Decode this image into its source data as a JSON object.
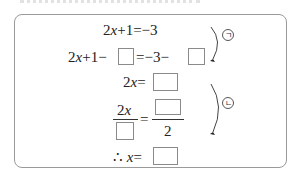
{
  "problem": {
    "steps": [
      {
        "id": "step1",
        "left": "2x+1",
        "eq": "=",
        "right": "−3"
      },
      {
        "id": "step2",
        "left_prefix": "2x+1−",
        "eq": "=",
        "right_prefix": "−3−",
        "blanks": 2
      },
      {
        "id": "step3",
        "left": "2x",
        "eq": "=",
        "blanks": 1
      },
      {
        "id": "step4",
        "numerator_left": "2x",
        "eq": "=",
        "denominator_right": "2",
        "blanks": 2
      },
      {
        "id": "step5",
        "therefore": "∴",
        "left": "x",
        "eq": "=",
        "blanks": 1
      }
    ],
    "annotations": [
      {
        "label": "ㄱ",
        "symbol": "circled-giyeok",
        "spans": "step1-step2"
      },
      {
        "label": "ㄴ",
        "symbol": "circled-nieun",
        "spans": "step3-step4"
      }
    ]
  },
  "texts": {
    "s1_a": "2",
    "s1_x": "x",
    "s1_b": "+1",
    "s1_eq": "=",
    "s1_r": "−3",
    "s2_a": "2",
    "s2_x": "x",
    "s2_b": "+1−",
    "s2_eq": "=",
    "s2_r": "−3−",
    "s3_a": "2",
    "s3_x": "x",
    "s3_eq": "=",
    "s4_num_a": "2",
    "s4_num_x": "x",
    "s4_eq": "=",
    "s4_den": "2",
    "s5_th": "∴",
    "s5_x": "x",
    "s5_eq": "=",
    "ann1": "ㄱ",
    "ann2": "ㄴ"
  }
}
